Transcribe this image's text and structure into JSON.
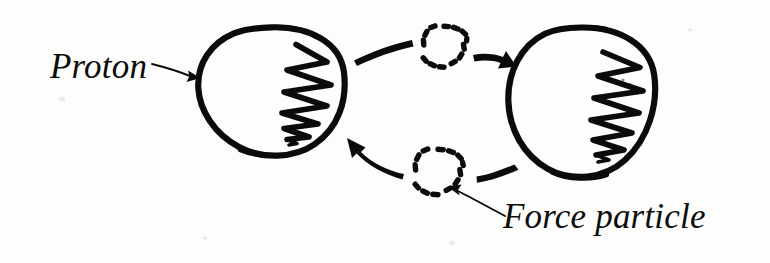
{
  "figure": {
    "background_color": "#fdfdfc",
    "ink_color": "#0b0b0b",
    "style": "hand-drawn black ink sketch on white paper"
  },
  "labels": {
    "proton": "Proton",
    "force_particle": "Force particle"
  },
  "particles": [
    {
      "id": "proton-left",
      "name": "Proton",
      "shape": "circle",
      "stroke": "solid",
      "center": [
        271,
        91
      ],
      "radius": [
        73,
        64
      ],
      "interior": "zigzag scribble"
    },
    {
      "id": "proton-right",
      "name": "Proton",
      "shape": "circle",
      "stroke": "solid",
      "center": [
        581,
        103
      ],
      "radius": [
        73,
        66
      ],
      "interior": "zigzag scribble"
    },
    {
      "id": "force-particle-top",
      "name": "Force particle",
      "shape": "circle",
      "stroke": "dashed",
      "center": [
        444,
        47
      ],
      "radius": [
        21,
        21
      ],
      "dashes": 13
    },
    {
      "id": "force-particle-bottom",
      "name": "Force particle",
      "shape": "circle",
      "stroke": "dashed",
      "center": [
        438,
        172
      ],
      "radius": [
        23,
        23
      ],
      "dashes": 13
    }
  ],
  "arrows": [
    {
      "id": "exchange-arrow-top",
      "from": "proton-left",
      "to": "proton-right",
      "direction": "right",
      "via": "force-particle-top"
    },
    {
      "id": "exchange-arrow-bottom",
      "from": "proton-right",
      "to": "proton-left",
      "direction": "left",
      "via": "force-particle-bottom"
    },
    {
      "id": "proton-pointer",
      "from": "proton-label",
      "to": "proton-left",
      "direction": "right"
    },
    {
      "id": "force-particle-pointer",
      "from": "force-particle-label",
      "to": "force-particle-bottom",
      "direction": "up-left"
    }
  ]
}
